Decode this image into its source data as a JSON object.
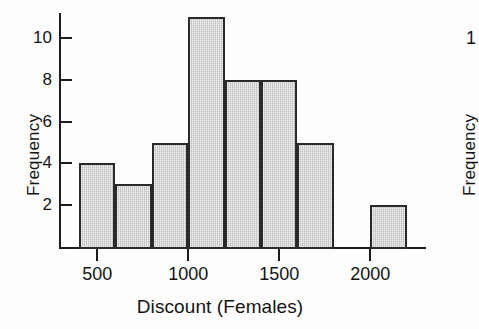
{
  "chart_data": {
    "type": "bar",
    "title": "",
    "subtitle": "",
    "xlabel": "Discount (Females)",
    "ylabel": "Frequency",
    "grid": false,
    "legend": null,
    "bin_width": 200,
    "bin_starts": [
      400,
      600,
      800,
      1000,
      1200,
      1400,
      1600,
      1800,
      2000
    ],
    "categories": [
      "400-600",
      "600-800",
      "800-1000",
      "1000-1200",
      "1200-1400",
      "1400-1600",
      "1600-1800",
      "1800-2000",
      "2000-2200"
    ],
    "values": [
      4,
      3,
      5,
      11,
      8,
      8,
      5,
      0,
      2
    ],
    "xlim": [
      300,
      2300
    ],
    "ylim": [
      0,
      11.5
    ],
    "xticks": [
      500,
      1000,
      1500,
      2000
    ],
    "xtick_labels": [
      "500",
      "1000",
      "1500",
      "2000"
    ],
    "yticks": [
      2,
      4,
      6,
      8,
      10
    ],
    "ytick_labels": [
      "2",
      "4",
      "6",
      "8",
      "10"
    ],
    "bar_fill_color": "#d2d2d2",
    "bar_border_color": "#2a2a2a",
    "axis_color": "#1d1d1d",
    "background_color": "#fdfdfd"
  },
  "axes": {
    "y_title": "Frequency",
    "x_title": "Discount (Females)"
  },
  "neighbour_chart": {
    "y_title": "Frequency",
    "partial_tick_label": "1"
  }
}
